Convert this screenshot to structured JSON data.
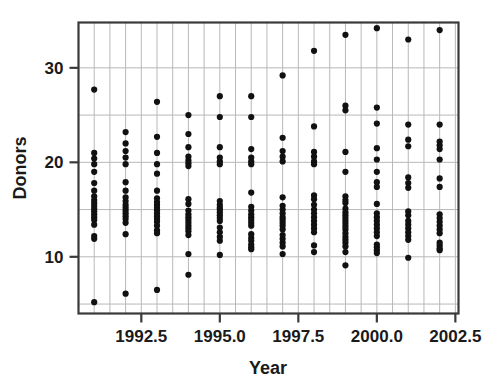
{
  "chart_data": {
    "type": "scatter",
    "title": "",
    "xlabel": "Year",
    "ylabel": "Donors",
    "xlim": [
      1990.5,
      2002.6
    ],
    "ylim": [
      4.0,
      34.8
    ],
    "grid": true,
    "grid_x_step": 0.5,
    "grid_y_step": 5,
    "legend": "none",
    "marker": "filled-circle",
    "marker_color": "#111111",
    "marker_radius": 3.1,
    "xticks": [
      1992.5,
      1995.0,
      1997.5,
      2000.0,
      2002.5
    ],
    "xtick_labels": [
      "1992.5",
      "1995.0",
      "1997.5",
      "2000.0",
      "2002.5"
    ],
    "yticks": [
      10,
      20,
      30
    ],
    "ytick_labels": [
      "10",
      "20",
      "30"
    ],
    "x": [
      1991,
      1991,
      1991,
      1991,
      1991,
      1991,
      1991,
      1991,
      1991,
      1991,
      1991,
      1991,
      1991,
      1991,
      1991,
      1991,
      1991,
      1991,
      1991,
      1991,
      1992,
      1992,
      1992,
      1992,
      1992,
      1992,
      1992,
      1992,
      1992,
      1992,
      1992,
      1992,
      1992,
      1992,
      1992,
      1992,
      1992,
      1992,
      1993,
      1993,
      1993,
      1993,
      1993,
      1993,
      1993,
      1993,
      1993,
      1993,
      1993,
      1993,
      1993,
      1993,
      1993,
      1993,
      1993,
      1993,
      1993,
      1994,
      1994,
      1994,
      1994,
      1994,
      1994,
      1994,
      1994,
      1994,
      1994,
      1994,
      1994,
      1994,
      1994,
      1994,
      1994,
      1994,
      1994,
      1994,
      1994,
      1995,
      1995,
      1995,
      1995,
      1995,
      1995,
      1995,
      1995,
      1995,
      1995,
      1995,
      1995,
      1995,
      1995,
      1995,
      1995,
      1995,
      1995,
      1995,
      1996,
      1996,
      1996,
      1996,
      1996,
      1996,
      1996,
      1996,
      1996,
      1996,
      1996,
      1996,
      1996,
      1996,
      1996,
      1996,
      1996,
      1996,
      1996,
      1996,
      1997,
      1997,
      1997,
      1997,
      1997,
      1997,
      1997,
      1997,
      1997,
      1997,
      1997,
      1997,
      1997,
      1997,
      1997,
      1997,
      1997,
      1997,
      1997,
      1998,
      1998,
      1998,
      1998,
      1998,
      1998,
      1998,
      1998,
      1998,
      1998,
      1998,
      1998,
      1998,
      1998,
      1998,
      1998,
      1998,
      1998,
      1999,
      1999,
      1999,
      1999,
      1999,
      1999,
      1999,
      1999,
      1999,
      1999,
      1999,
      1999,
      1999,
      1999,
      1999,
      1999,
      1999,
      1999,
      1999,
      1999,
      1999,
      1999,
      1999,
      2000,
      2000,
      2000,
      2000,
      2000,
      2000,
      2000,
      2000,
      2000,
      2000,
      2000,
      2000,
      2000,
      2000,
      2000,
      2000,
      2000,
      2000,
      2000,
      2000,
      2001,
      2001,
      2001,
      2001,
      2001,
      2001,
      2001,
      2001,
      2001,
      2001,
      2001,
      2001,
      2001,
      2001,
      2001,
      2001,
      2002,
      2002,
      2002,
      2002,
      2002,
      2002,
      2002,
      2002,
      2002,
      2002,
      2002,
      2002,
      2002,
      2002,
      2002,
      2002,
      2002,
      2002
    ],
    "y": [
      27.7,
      21.0,
      20.4,
      19.8,
      19.0,
      17.8,
      17.0,
      16.4,
      16.0,
      15.7,
      15.4,
      15.1,
      14.8,
      14.5,
      14.2,
      13.9,
      13.4,
      12.2,
      11.9,
      5.2,
      23.2,
      22.0,
      21.2,
      20.5,
      19.8,
      17.9,
      17.0,
      16.3,
      15.9,
      15.5,
      15.2,
      14.9,
      14.6,
      14.3,
      14.0,
      13.6,
      12.4,
      6.1,
      26.4,
      22.7,
      21.0,
      19.8,
      18.8,
      17.0,
      16.2,
      15.8,
      15.5,
      15.2,
      14.9,
      14.6,
      14.3,
      14.0,
      13.7,
      13.3,
      12.8,
      12.5,
      6.5,
      25.0,
      23.0,
      21.6,
      20.6,
      20.2,
      19.9,
      19.6,
      16.1,
      15.6,
      14.9,
      14.5,
      14.2,
      13.9,
      13.6,
      13.3,
      13.0,
      12.7,
      12.3,
      10.3,
      8.1,
      27.0,
      24.8,
      21.6,
      20.5,
      20.1,
      19.8,
      15.9,
      15.5,
      15.2,
      15.0,
      14.7,
      14.4,
      14.1,
      13.8,
      13.1,
      12.6,
      12.1,
      11.7,
      10.2,
      27.0,
      24.8,
      21.4,
      20.5,
      20.1,
      19.8,
      16.8,
      15.3,
      14.9,
      14.5,
      14.2,
      13.9,
      13.6,
      13.3,
      12.4,
      12.0,
      11.7,
      11.3,
      11.0,
      10.8,
      29.2,
      22.6,
      21.2,
      20.6,
      20.1,
      16.3,
      15.4,
      15.0,
      14.6,
      14.2,
      13.9,
      13.6,
      13.3,
      12.9,
      12.3,
      11.9,
      11.5,
      11.1,
      10.3,
      31.8,
      23.8,
      21.1,
      20.6,
      20.1,
      19.8,
      16.5,
      16.1,
      15.5,
      15.0,
      14.6,
      14.2,
      13.8,
      13.4,
      13.0,
      12.6,
      11.2,
      10.5,
      33.5,
      26.0,
      25.5,
      21.1,
      19.0,
      16.4,
      16.0,
      15.7,
      15.1,
      14.7,
      14.4,
      14.1,
      13.8,
      13.5,
      13.2,
      12.9,
      12.5,
      12.1,
      11.8,
      11.5,
      11.1,
      10.5,
      9.1,
      34.2,
      25.8,
      24.1,
      21.5,
      20.3,
      19.0,
      17.9,
      17.4,
      15.6,
      14.6,
      14.2,
      13.8,
      13.4,
      13.0,
      12.6,
      12.2,
      11.3,
      11.0,
      10.7,
      10.4,
      33.0,
      24.0,
      22.4,
      21.7,
      18.4,
      17.8,
      17.3,
      14.8,
      14.4,
      13.8,
      13.4,
      13.0,
      12.6,
      12.2,
      11.8,
      9.9,
      34.0,
      24.0,
      22.2,
      21.8,
      21.4,
      20.3,
      18.3,
      17.4,
      14.5,
      14.1,
      13.7,
      13.3,
      12.9,
      12.5,
      11.5,
      11.2,
      10.9,
      10.7
    ]
  },
  "axes": {
    "y_title": "Donors",
    "x_title": "Year"
  }
}
